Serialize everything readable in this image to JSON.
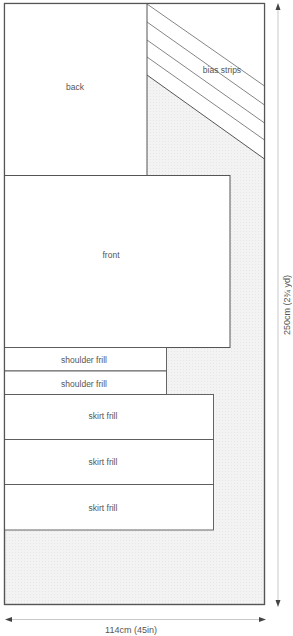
{
  "diagram": {
    "type": "cutting-layout",
    "colors": {
      "outline": "#555555",
      "fabric_waste": "#f0f0f0",
      "piece_fill": "#ffffff",
      "text": "#555555"
    },
    "pieces": [
      {
        "id": "back",
        "label": "back"
      },
      {
        "id": "bias",
        "label": "bias strips"
      },
      {
        "id": "front",
        "label": "front"
      },
      {
        "id": "shoulder1",
        "label": "shoulder frill"
      },
      {
        "id": "shoulder2",
        "label": "shoulder frill"
      },
      {
        "id": "skirt1",
        "label": "skirt frill"
      },
      {
        "id": "skirt2",
        "label": "skirt frill"
      },
      {
        "id": "skirt3",
        "label": "skirt frill"
      }
    ],
    "dimensions": {
      "length": "250cm (2¾ yd)",
      "width": "114cm (45in)"
    }
  }
}
